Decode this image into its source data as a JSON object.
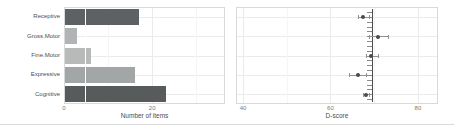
{
  "chart_data": [
    {
      "type": "bar",
      "orientation": "horizontal",
      "title": "",
      "xlabel": "Number of items",
      "ylabel": "",
      "categories": [
        "Receptive",
        "Gross.Motor",
        "Fine.Motor",
        "Expressive",
        "Cognitive"
      ],
      "values": [
        17,
        3,
        6,
        16,
        23
      ],
      "bar_colors": [
        "#5d6164",
        "#b1b4b4",
        "#b8baba",
        "#a3a6a6",
        "#575b5c"
      ],
      "xticks": [
        0,
        20
      ],
      "xticks_minor": [
        10,
        30
      ],
      "xlim": [
        0,
        36.5
      ],
      "reference_line": {
        "value": 4.7,
        "color": "#ffffff"
      },
      "grid": true,
      "legend": "none"
    },
    {
      "type": "scatter",
      "title": "",
      "xlabel": "D-score",
      "ylabel": "",
      "categories": [
        "Receptive",
        "Gross.Motor",
        "Fine.Motor",
        "Expressive",
        "Cognitive"
      ],
      "series": [
        {
          "name": "domain D-score with confidence interval",
          "values": [
            67.5,
            70.8,
            69.3,
            66.2,
            68.2
          ],
          "ci_low": [
            66.2,
            68.9,
            68.2,
            64.2,
            67.4
          ],
          "ci_high": [
            68.7,
            73.1,
            70.8,
            68.2,
            68.9
          ]
        }
      ],
      "xticks": [
        40,
        60,
        80
      ],
      "xticks_minor": [
        50,
        70
      ],
      "xlim": [
        38.4,
        84.6
      ],
      "reference_line": {
        "value": 69.6,
        "color": "#4d4d4d"
      },
      "rug": {
        "count": 19,
        "side": "left"
      },
      "point_color": "#474b4d",
      "errorbar_color": "#8f9192",
      "grid": true,
      "legend": "none"
    }
  ],
  "colors": {
    "background": "#ffffff",
    "grid_major": "#ebebeb",
    "grid_minor": "#f5f5f5",
    "panel_border": "#d9d9d9",
    "axis_text": "#4d4d4d",
    "tick_text": "#7a7a7a",
    "divider": "#d9d9d9",
    "rug_tick": "#8a8a8a"
  }
}
